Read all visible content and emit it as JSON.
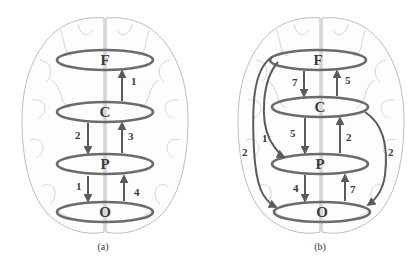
{
  "colors": {
    "ring": "#6b6b6b",
    "arrow": "#5a5a5a",
    "brain_outline": "#bdbdbd",
    "text": "#3a3a3a"
  },
  "panels": [
    {
      "caption": "(a)",
      "nodes": [
        {
          "id": "F",
          "label": "F"
        },
        {
          "id": "C",
          "label": "C"
        },
        {
          "id": "P",
          "label": "P"
        },
        {
          "id": "O",
          "label": "O"
        }
      ],
      "edges": [
        {
          "from": "C",
          "to": "F",
          "weight": "1"
        },
        {
          "from": "C",
          "to": "P",
          "weight": "2"
        },
        {
          "from": "P",
          "to": "C",
          "weight": "3"
        },
        {
          "from": "P",
          "to": "O",
          "weight": "1"
        },
        {
          "from": "O",
          "to": "P",
          "weight": "4"
        }
      ]
    },
    {
      "caption": "(b)",
      "nodes": [
        {
          "id": "F",
          "label": "F"
        },
        {
          "id": "C",
          "label": "C"
        },
        {
          "id": "P",
          "label": "P"
        },
        {
          "id": "O",
          "label": "O"
        }
      ],
      "edges": [
        {
          "from": "F",
          "to": "C",
          "weight": "7"
        },
        {
          "from": "C",
          "to": "F",
          "weight": "5"
        },
        {
          "from": "C",
          "to": "P",
          "weight": "5"
        },
        {
          "from": "P",
          "to": "C",
          "weight": "2"
        },
        {
          "from": "P",
          "to": "O",
          "weight": "4"
        },
        {
          "from": "O",
          "to": "P",
          "weight": "7"
        },
        {
          "from": "F",
          "to": "P",
          "weight": "1"
        },
        {
          "from": "F",
          "to": "O",
          "weight": "2"
        },
        {
          "from": "C",
          "to": "O",
          "weight": "2"
        }
      ]
    }
  ]
}
